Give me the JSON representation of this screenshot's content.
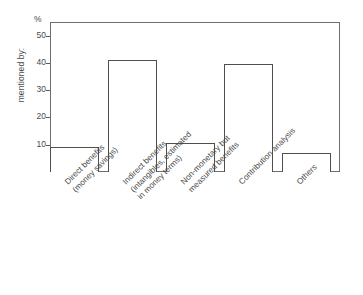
{
  "chart_data": {
    "type": "bar",
    "title": "",
    "subtitle": "",
    "xlabel": "",
    "ylabel": "mentioned by:",
    "unit_label": "%",
    "categories": [
      "Direct benefits\n(money savings)",
      "Indirect benefits\n(intangibles, estimated\nin money terms)",
      "Non-monetary but\nmeasured benefits",
      "Contribution analysis",
      "Others"
    ],
    "values": [
      9,
      41,
      10.5,
      39.5,
      7
    ],
    "ylim": [
      0,
      55
    ],
    "yticks": [
      10,
      20,
      30,
      40,
      50
    ],
    "ytick_labels": [
      "10",
      "20",
      "30",
      "40",
      "50"
    ],
    "grid": false,
    "legend": "none",
    "bar_fill": "#ffffff",
    "bar_edge": "#4f4f4f",
    "frame_color": "#6e6e6e",
    "text_color": "#4a4a4a",
    "background": "#ffffff"
  },
  "axis": {
    "y_title": "mentioned by:",
    "percent_symbol": "%",
    "ticks": [
      {
        "value": 50,
        "label": "50"
      },
      {
        "value": 40,
        "label": "40"
      },
      {
        "value": 30,
        "label": "30"
      },
      {
        "value": 20,
        "label": "20"
      },
      {
        "value": 10,
        "label": "10"
      }
    ]
  },
  "categories": [
    {
      "id": "direct-benefits",
      "line1": "Direct benefits",
      "line2": "(money savings)",
      "line3": "",
      "value": 9
    },
    {
      "id": "indirect-benefits",
      "line1": "Indirect benefits",
      "line2": "(intangibles, estimated",
      "line3": "in money terms)",
      "value": 41
    },
    {
      "id": "non-monetary-measured-benefits",
      "line1": "Non-monetary but",
      "line2": "measured benefits",
      "line3": "",
      "value": 10.5
    },
    {
      "id": "contribution-analysis",
      "line1": "Contribution analysis",
      "line2": "",
      "line3": "",
      "value": 39.5
    },
    {
      "id": "others",
      "line1": "Others",
      "line2": "",
      "line3": "",
      "value": 7
    }
  ]
}
